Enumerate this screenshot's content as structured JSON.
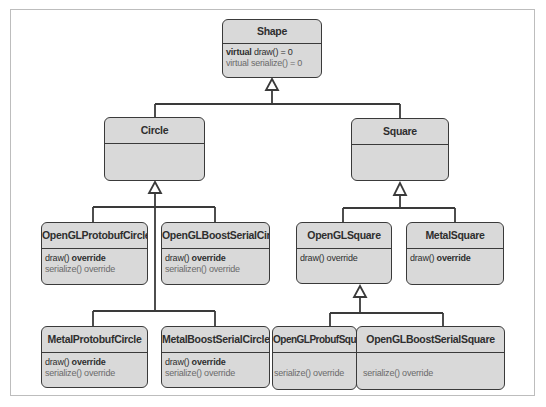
{
  "diagram": {
    "type": "uml-class-hierarchy",
    "colors": {
      "box_fill": "#d9d9d9",
      "box_border": "#3a3a3a",
      "frame": "#bdbdbd",
      "text": "#2e2e2e",
      "muted_text": "#6a6a6a"
    },
    "classes": {
      "shape": {
        "name": "Shape",
        "members": [
          {
            "keyword": "virtual",
            "rest": " draw() = 0",
            "style": "normal"
          },
          {
            "keyword": "virtual",
            "rest": " serialize() = 0",
            "style": "gray"
          }
        ]
      },
      "circle": {
        "name": "Circle",
        "members": []
      },
      "square": {
        "name": "Square",
        "members": []
      },
      "opengl_protobuf_circle": {
        "name": "OpenGLProtobufCircle",
        "members": [
          {
            "text": "draw()",
            "keyword": " override",
            "style": "normal"
          },
          {
            "text": "serialize()",
            "keyword": " override",
            "style": "gray"
          }
        ]
      },
      "opengl_boost_serial_circle": {
        "name": "OpenGLBoostSerialCircle",
        "members": [
          {
            "text": "draw()",
            "keyword": " override",
            "style": "normal"
          },
          {
            "text": "serializen()",
            "keyword": " override",
            "style": "gray"
          }
        ]
      },
      "opengl_square": {
        "name": "OpenGLSquare",
        "members": [
          {
            "text": "draw()",
            "keyword": " override",
            "style": "normal"
          }
        ]
      },
      "metal_square": {
        "name": "MetalSquare",
        "members": [
          {
            "text": "draw()",
            "keyword": " override",
            "style": "normal"
          }
        ]
      },
      "metal_protobuf_circle": {
        "name": "MetalProtobufCircle",
        "members": [
          {
            "text": "draw()",
            "keyword": " override",
            "style": "normal"
          },
          {
            "text": "serialize()",
            "keyword": " override",
            "style": "gray"
          }
        ]
      },
      "metal_boost_serial_circle": {
        "name": "MetalBoostSerialCircle",
        "members": [
          {
            "text": "draw()",
            "keyword": " override",
            "style": "normal"
          },
          {
            "text": "serialize()",
            "keyword": " override",
            "style": "gray"
          }
        ]
      },
      "opengl_probuf_square": {
        "name": "OpenGLProbufSquare",
        "members": [
          {
            "text": "serialize()",
            "keyword": " override",
            "style": "gray"
          }
        ]
      },
      "opengl_boost_serial_square": {
        "name": "OpenGLBoostSerialSquare",
        "members": [
          {
            "text": "serialize()",
            "keyword": " override",
            "style": "gray"
          }
        ]
      }
    },
    "inheritance": [
      {
        "child": "Circle",
        "parent": "Shape"
      },
      {
        "child": "Square",
        "parent": "Shape"
      },
      {
        "child": "OpenGLProtobufCircle",
        "parent": "Circle"
      },
      {
        "child": "OpenGLBoostSerialCircle",
        "parent": "Circle"
      },
      {
        "child": "MetalProtobufCircle",
        "parent": "Circle"
      },
      {
        "child": "MetalBoostSerialCircle",
        "parent": "Circle"
      },
      {
        "child": "OpenGLSquare",
        "parent": "Square"
      },
      {
        "child": "MetalSquare",
        "parent": "Square"
      },
      {
        "child": "OpenGLProbufSquare",
        "parent": "OpenGLSquare"
      },
      {
        "child": "OpenGLBoostSerialSquare",
        "parent": "OpenGLSquare"
      }
    ]
  }
}
